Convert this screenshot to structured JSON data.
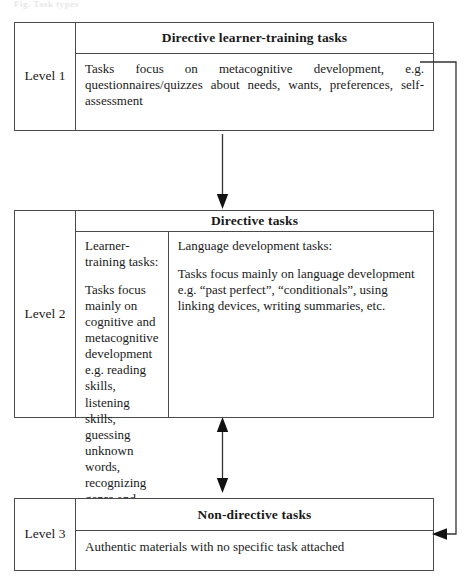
{
  "page": {
    "running_header": "Fig.  Task types"
  },
  "diagram": {
    "levels": [
      {
        "label": "Level 1",
        "heading": "Directive learner-training tasks",
        "columns": [
          {
            "paragraphs": [
              "Tasks focus on metacognitive development, e.g. questionnaires/quizzes about needs, wants, preferences, self-assessment"
            ]
          }
        ]
      },
      {
        "label": "Level 2",
        "heading": "Directive tasks",
        "columns": [
          {
            "paragraphs": [
              "Learner-training tasks:",
              "Tasks focus mainly on cognitive and metacognitive development e.g. reading skills, listening skills, guessing unknown words, recognizing genre and discourse structure etc."
            ]
          },
          {
            "paragraphs": [
              "Language development tasks:",
              "Tasks focus mainly on language development e.g. “past perfect”, “conditionals”, using linking devices, writing summaries, etc."
            ]
          }
        ]
      },
      {
        "label": "Level 3",
        "heading": "Non-directive tasks",
        "columns": [
          {
            "paragraphs": [
              "Authentic materials with no specific task attached"
            ]
          }
        ]
      }
    ],
    "connectors": [
      {
        "name": "level-1-to-level-2",
        "style": "single-arrow-down"
      },
      {
        "name": "level-2-to-level-3",
        "style": "double-arrow-vertical"
      },
      {
        "name": "level-1-to-level-3-feedback",
        "style": "elbow-arrow-left"
      }
    ],
    "colors": {
      "border": "#4a4a4a",
      "text": "#1a1a1a",
      "background": "#ffffff",
      "connector": "#333333"
    }
  }
}
